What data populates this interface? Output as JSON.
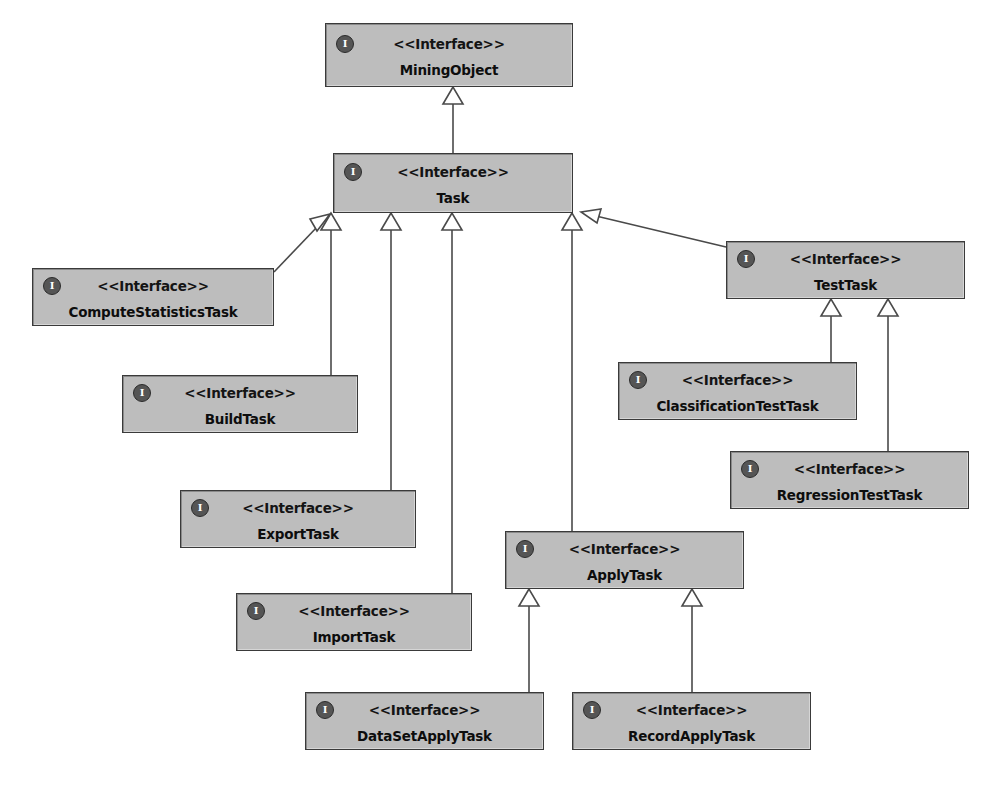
{
  "diagram": {
    "type": "uml-class-diagram",
    "title": "",
    "stereotype_label": "<<Interface>>",
    "icon_glyph": "I",
    "icon_name": "interface-icon",
    "colors": {
      "box_fill": "#bdbdbd",
      "box_border": "#3a3a3a",
      "text": "#0d0d0d",
      "edge": "#4a4a4a",
      "background": "#ffffff",
      "icon_fill": "#555555"
    },
    "nodes": [
      {
        "id": "MiningObject",
        "name": "MiningObject",
        "stereotype": "<<Interface>>",
        "x": 325,
        "y": 23,
        "w": 248,
        "h": 64
      },
      {
        "id": "Task",
        "name": "Task",
        "stereotype": "<<Interface>>",
        "x": 333,
        "y": 153,
        "w": 240,
        "h": 60
      },
      {
        "id": "ComputeStatisticsTask",
        "name": "ComputeStatisticsTask",
        "stereotype": "<<Interface>>",
        "x": 32,
        "y": 268,
        "w": 242,
        "h": 58
      },
      {
        "id": "BuildTask",
        "name": "BuildTask",
        "stereotype": "<<Interface>>",
        "x": 122,
        "y": 375,
        "w": 236,
        "h": 58
      },
      {
        "id": "ExportTask",
        "name": "ExportTask",
        "stereotype": "<<Interface>>",
        "x": 180,
        "y": 490,
        "w": 236,
        "h": 58
      },
      {
        "id": "ImportTask",
        "name": "ImportTask",
        "stereotype": "<<Interface>>",
        "x": 236,
        "y": 593,
        "w": 236,
        "h": 58
      },
      {
        "id": "TestTask",
        "name": "TestTask",
        "stereotype": "<<Interface>>",
        "x": 726,
        "y": 241,
        "w": 239,
        "h": 58
      },
      {
        "id": "ClassificationTestTask",
        "name": "ClassificationTestTask",
        "stereotype": "<<Interface>>",
        "x": 618,
        "y": 362,
        "w": 239,
        "h": 58
      },
      {
        "id": "RegressionTestTask",
        "name": "RegressionTestTask",
        "stereotype": "<<Interface>>",
        "x": 730,
        "y": 451,
        "w": 239,
        "h": 58
      },
      {
        "id": "ApplyTask",
        "name": "ApplyTask",
        "stereotype": "<<Interface>>",
        "x": 505,
        "y": 531,
        "w": 239,
        "h": 58
      },
      {
        "id": "DataSetApplyTask",
        "name": "DataSetApplyTask",
        "stereotype": "<<Interface>>",
        "x": 305,
        "y": 692,
        "w": 239,
        "h": 58
      },
      {
        "id": "RecordApplyTask",
        "name": "RecordApplyTask",
        "stereotype": "<<Interface>>",
        "x": 572,
        "y": 692,
        "w": 239,
        "h": 58
      }
    ],
    "edges": [
      {
        "from": "Task",
        "to": "MiningObject",
        "kind": "generalization",
        "label": ""
      },
      {
        "from": "ComputeStatisticsTask",
        "to": "Task",
        "kind": "generalization",
        "label": ""
      },
      {
        "from": "BuildTask",
        "to": "Task",
        "kind": "generalization",
        "label": ""
      },
      {
        "from": "ExportTask",
        "to": "Task",
        "kind": "generalization",
        "label": ""
      },
      {
        "from": "ImportTask",
        "to": "Task",
        "kind": "generalization",
        "label": ""
      },
      {
        "from": "TestTask",
        "to": "Task",
        "kind": "generalization",
        "label": ""
      },
      {
        "from": "ApplyTask",
        "to": "Task",
        "kind": "generalization",
        "label": ""
      },
      {
        "from": "ClassificationTestTask",
        "to": "TestTask",
        "kind": "generalization",
        "label": ""
      },
      {
        "from": "RegressionTestTask",
        "to": "TestTask",
        "kind": "generalization",
        "label": ""
      },
      {
        "from": "DataSetApplyTask",
        "to": "ApplyTask",
        "kind": "generalization",
        "label": ""
      },
      {
        "from": "RecordApplyTask",
        "to": "ApplyTask",
        "kind": "generalization",
        "label": ""
      }
    ]
  }
}
